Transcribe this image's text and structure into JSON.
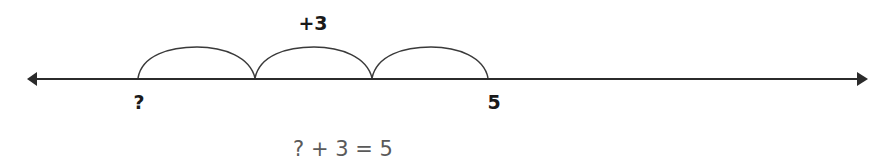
{
  "diagram": {
    "type": "number-line",
    "jump_label": "+3",
    "start_label": "?",
    "end_label": "5",
    "equation": "? + 3 = 5",
    "jumps": 3,
    "colors": {
      "line": "#2b2b2b",
      "arc": "#3a3a3a",
      "label": "#1a1a1a",
      "equation": "#5a5a5a",
      "background": "#ffffff"
    }
  }
}
